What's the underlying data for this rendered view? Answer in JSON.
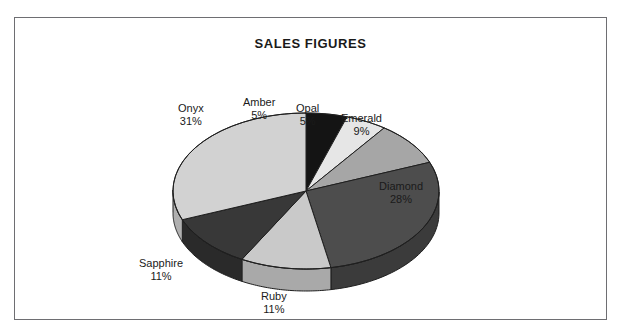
{
  "chart_data": {
    "type": "pie",
    "title": "SALES FIGURES",
    "three_d": true,
    "labels": [
      "Amber",
      "Opal",
      "Emerald",
      "Diamond",
      "Ruby",
      "Sapphire",
      "Onyx"
    ],
    "values": [
      5,
      5,
      9,
      28,
      11,
      11,
      31
    ],
    "value_suffix": "%",
    "start_angle_deg": 0,
    "direction": "clockwise",
    "legend": "none",
    "grid": false,
    "colors": [
      "#141414",
      "#e6e6e6",
      "#a6a6a6",
      "#4d4d4d",
      "#c9c9c9",
      "#383838",
      "#d2d2d2"
    ],
    "side_colors": [
      "#0c0c0c",
      "#bdbdbd",
      "#878787",
      "#3b3b3b",
      "#a9a9a9",
      "#2a2a2a",
      "#b0b0b0"
    ],
    "slices": [
      {
        "name": "Amber",
        "value": 5,
        "percent_text": "5%",
        "color": "#141414"
      },
      {
        "name": "Opal",
        "value": 5,
        "percent_text": "5%",
        "color": "#e6e6e6"
      },
      {
        "name": "Emerald",
        "value": 9,
        "percent_text": "9%",
        "color": "#a6a6a6"
      },
      {
        "name": "Diamond",
        "value": 28,
        "percent_text": "28%",
        "color": "#4d4d4d"
      },
      {
        "name": "Ruby",
        "value": 11,
        "percent_text": "11%",
        "color": "#c9c9c9"
      },
      {
        "name": "Sapphire",
        "value": 11,
        "percent_text": "11%",
        "color": "#383838"
      },
      {
        "name": "Onyx",
        "value": 31,
        "percent_text": "31%",
        "color": "#d2d2d2"
      }
    ]
  },
  "labels": {
    "amber": {
      "name": "Amber",
      "pct": "5%"
    },
    "opal": {
      "name": "Opal",
      "pct": "5%"
    },
    "emerald": {
      "name": "Emerald",
      "pct": "9%"
    },
    "diamond": {
      "name": "Diamond",
      "pct": "28%"
    },
    "ruby": {
      "name": "Ruby",
      "pct": "11%"
    },
    "sapphire": {
      "name": "Sapphire",
      "pct": "11%"
    },
    "onyx": {
      "name": "Onyx",
      "pct": "31%"
    }
  },
  "style": {
    "border_color": "#6e6e72",
    "background": "#ffffff",
    "text_color": "#1a1a1a",
    "outline_color": "#1f1f1f"
  }
}
